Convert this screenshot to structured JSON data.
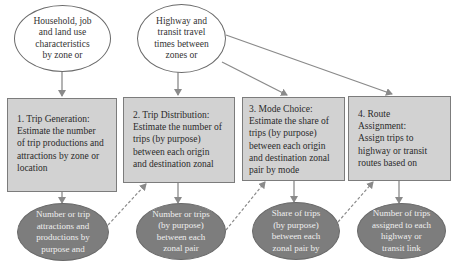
{
  "inputs": [
    {
      "id": "input-land-use",
      "text": "Household, job\nand land use\ncharacteristics\nby zone or"
    },
    {
      "id": "input-travel-times",
      "text": "Highway and\ntransit travel\ntimes between\nzones or"
    }
  ],
  "steps": [
    {
      "number": "1",
      "text": "1. Trip Generation:\nEstimate the number\nof trip productions and\nattractions by zone or\nlocation"
    },
    {
      "number": "2",
      "text": "2. Trip Distribution:\nEstimate the number of\ntrips (by purpose)\nbetween each origin\nand destination zonal"
    },
    {
      "number": "3",
      "text": "3. Mode Choice:\nEstimate the share of\ntrips (by purpose)\nbetween each origin\nand destination zonal\npair by mode"
    },
    {
      "number": "4",
      "text": "4. Route\nAssignment:\nAssign trips to\nhighway or transit\nroutes based on"
    }
  ],
  "outputs": [
    {
      "text": "Number or trip\nattractions and\nproductions by\npurpose and"
    },
    {
      "text": "Number or trips\n(by purpose)\nbetween each\nzonal pair"
    },
    {
      "text": "Share of trips\n(by purpose)\nbetween each\nzonal pair by"
    },
    {
      "text": "Number of trips\nassigned to each\nhighway or\ntransit link"
    }
  ],
  "colors": {
    "box_fill": "#d2d2d2",
    "output_fill": "#7d7d7d",
    "line": "#8a8a8a"
  }
}
